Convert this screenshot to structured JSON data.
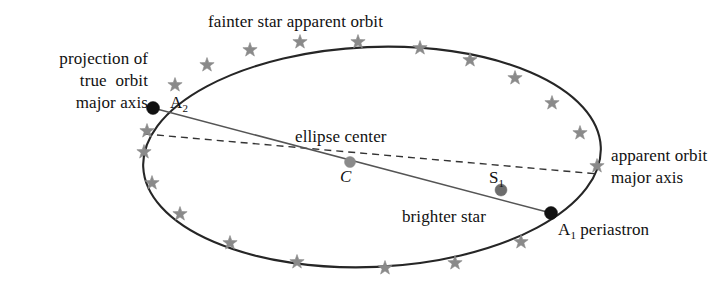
{
  "figure": {
    "background_color": "#ffffff",
    "orbit_stroke_color": "#262626",
    "chord_stroke_color": "#555555",
    "dashed_stroke_color": "#333333",
    "star_marker_color": "#8a8a8a",
    "primary_point_color": "#111111",
    "secondary_point_color": "#777777"
  },
  "labels": {
    "projection_true_orbit": "projection of\ntrue  orbit\nmajor axis",
    "fainter_star_orbit": "fainter star apparent orbit",
    "ellipse_center": "ellipse center",
    "apparent_orbit_axis": "apparent orbit\nmajor axis",
    "brighter_star": "brighter star",
    "a1_periastron_prefix": "A",
    "a1_periastron_sub": "1",
    "a1_periastron_suffix": " periastron",
    "a2_prefix": "A",
    "a2_sub": "2",
    "center_point": "C",
    "s1_prefix": "S",
    "s1_sub": "1"
  },
  "geometry": {
    "ellipse": {
      "center_x": 372,
      "center_y": 157,
      "semi_major": 229,
      "semi_minor": 110,
      "rotation_deg": -2.5
    },
    "points": {
      "A2": {
        "x": 153,
        "y": 108,
        "kind": "apoastron-projection",
        "color": "#111111",
        "radius": 6.5
      },
      "A1": {
        "x": 551,
        "y": 213,
        "kind": "periastron",
        "color": "#111111",
        "radius": 6.5
      },
      "C": {
        "x": 350,
        "y": 162,
        "kind": "ellipse-center",
        "color": "#8a8a8a",
        "radius": 5.5
      },
      "S1": {
        "x": 501,
        "y": 190,
        "kind": "brighter-star",
        "color": "#6d6d6d",
        "radius": 6
      }
    },
    "true_axis_line": {
      "x1": 153,
      "y1": 108,
      "x2": 551,
      "y2": 213
    },
    "apparent_axis_dashed": {
      "x1": 145,
      "y1": 134,
      "x2": 598,
      "y2": 174
    },
    "star_markers": [
      {
        "x": 175,
        "y": 85
      },
      {
        "x": 207,
        "y": 65
      },
      {
        "x": 250,
        "y": 50
      },
      {
        "x": 300,
        "y": 42
      },
      {
        "x": 358,
        "y": 42
      },
      {
        "x": 420,
        "y": 48
      },
      {
        "x": 470,
        "y": 60
      },
      {
        "x": 515,
        "y": 78
      },
      {
        "x": 552,
        "y": 103
      },
      {
        "x": 580,
        "y": 133
      },
      {
        "x": 597,
        "y": 166
      },
      {
        "x": 521,
        "y": 242
      },
      {
        "x": 455,
        "y": 263
      },
      {
        "x": 385,
        "y": 268
      },
      {
        "x": 297,
        "y": 262
      },
      {
        "x": 230,
        "y": 243
      },
      {
        "x": 180,
        "y": 214
      },
      {
        "x": 152,
        "y": 183
      },
      {
        "x": 144,
        "y": 152
      },
      {
        "x": 147,
        "y": 131
      }
    ]
  }
}
